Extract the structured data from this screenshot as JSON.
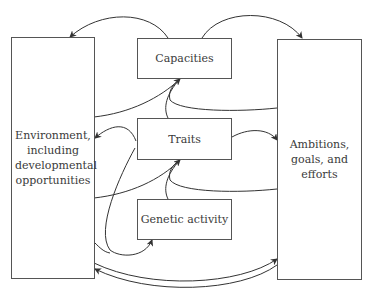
{
  "diagram": {
    "nodes": {
      "environment": {
        "label": "Environment, including developmental opportunities"
      },
      "ambitions": {
        "label": "Ambitions, goals, and efforts"
      },
      "capacities": {
        "label": "Capacities"
      },
      "traits": {
        "label": "Traits"
      },
      "genetic": {
        "label": "Genetic activity"
      }
    },
    "edges": [
      {
        "from": "capacities",
        "to": "environment"
      },
      {
        "from": "capacities",
        "to": "ambitions"
      },
      {
        "from": "environment",
        "to": "capacities"
      },
      {
        "from": "ambitions",
        "to": "capacities"
      },
      {
        "from": "traits",
        "to": "capacities"
      },
      {
        "from": "traits",
        "to": "environment"
      },
      {
        "from": "traits",
        "to": "ambitions"
      },
      {
        "from": "environment",
        "to": "traits"
      },
      {
        "from": "ambitions",
        "to": "traits"
      },
      {
        "from": "genetic",
        "to": "traits"
      },
      {
        "from": "traits",
        "to": "genetic"
      },
      {
        "from": "environment",
        "to": "ambitions"
      },
      {
        "from": "ambitions",
        "to": "environment"
      }
    ],
    "colors": {
      "stroke": "#333333",
      "background": "#ffffff"
    }
  }
}
